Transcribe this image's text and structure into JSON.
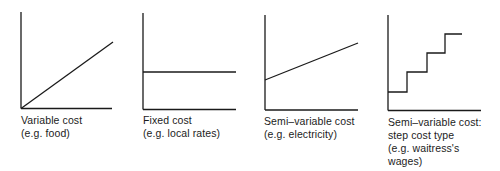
{
  "diagram": {
    "title": "",
    "line_color": "#1a1a1a",
    "panels": [
      {
        "id": "variable",
        "caption": [
          "Variable cost",
          "(e.g. food)"
        ],
        "type": "line",
        "description": "Line rising from origin",
        "points": [
          [
            0,
            0
          ],
          [
            1,
            1
          ]
        ]
      },
      {
        "id": "fixed",
        "caption": [
          "Fixed cost",
          "(e.g. local rates)"
        ],
        "type": "line",
        "description": "Horizontal line at constant level",
        "points": [
          [
            0,
            0.4
          ],
          [
            1,
            0.4
          ]
        ]
      },
      {
        "id": "semi-variable",
        "caption": [
          "Semi–variable cost",
          "(e.g. electricity)"
        ],
        "type": "line",
        "description": "Line rising from a positive intercept",
        "points": [
          [
            0,
            0.33
          ],
          [
            1,
            0.72
          ]
        ]
      },
      {
        "id": "step",
        "caption": [
          "Semi–variable cost:",
          "step cost type",
          "(e.g. waitress's",
          " wages)"
        ],
        "type": "step",
        "description": "Staircase rising in four steps",
        "points": [
          [
            0,
            0.2
          ],
          [
            0.25,
            0.2
          ],
          [
            0.25,
            0.41
          ],
          [
            0.5,
            0.41
          ],
          [
            0.5,
            0.62
          ],
          [
            0.73,
            0.62
          ],
          [
            0.73,
            0.81
          ],
          [
            0.95,
            0.81
          ]
        ]
      }
    ]
  }
}
